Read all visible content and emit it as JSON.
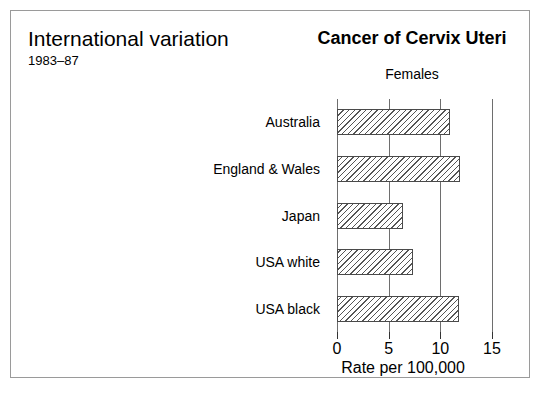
{
  "figure": {
    "left_title": "International variation",
    "left_subtitle": "1983–87",
    "right_title": "Cancer of Cervix Uteri",
    "right_subtitle": "Females",
    "frame_color": "#9a9a9a",
    "background": "#ffffff"
  },
  "chart_data": {
    "type": "bar",
    "orientation": "horizontal",
    "title": "Cancer of Cervix Uteri",
    "subtitle": "Females",
    "categories": [
      "Australia",
      "England & Wales",
      "Japan",
      "USA white",
      "USA black"
    ],
    "values": [
      10.9,
      11.9,
      6.4,
      7.4,
      11.8
    ],
    "xlabel": "Rate per 100,000",
    "ylabel": "",
    "xlim": [
      0,
      15
    ],
    "xticks": [
      0,
      5,
      10,
      15
    ],
    "xtick_labels": [
      "0",
      "5",
      "10",
      "15"
    ],
    "grid": true,
    "grid_axis": "x",
    "legend": false,
    "bar_fill": "diagonal-hatch",
    "bar_edge_color": "#4a4a4a",
    "gridline_color": "#6e6e6e"
  }
}
